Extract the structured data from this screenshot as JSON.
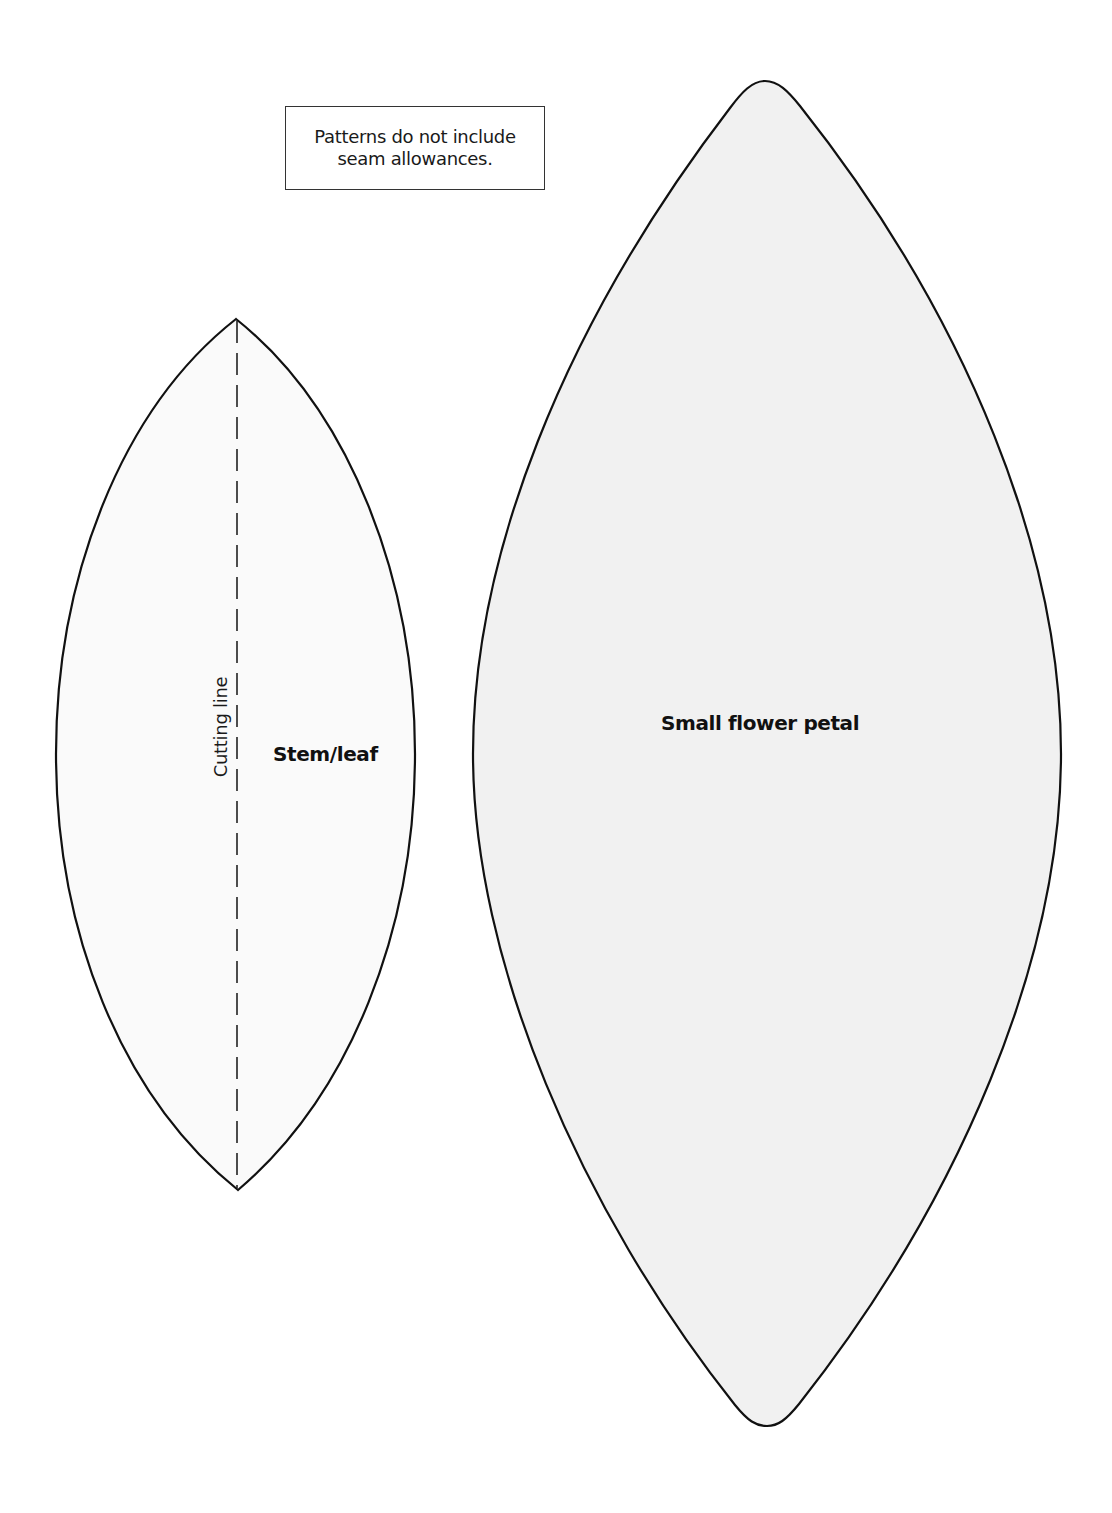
{
  "page": {
    "background": "#ffffff"
  },
  "note": {
    "line1": "Patterns do not include",
    "line2": "seam allowances."
  },
  "patterns": [
    {
      "id": "stem-leaf",
      "label": "Stem/leaf",
      "fill": "#fafafa",
      "stroke": "#111111",
      "cutting_line": {
        "label": "Cutting line",
        "style": "dashed"
      }
    },
    {
      "id": "small-flower-petal",
      "label": "Small flower petal",
      "fill": "#f1f1f1",
      "stroke": "#111111"
    }
  ]
}
